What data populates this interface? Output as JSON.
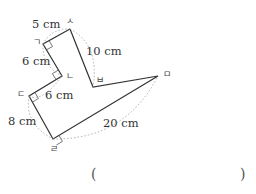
{
  "figure": {
    "vertices": [
      {
        "name": "ㄱ",
        "x": 43,
        "y": 44
      },
      {
        "name": "ㄴ",
        "x": 62,
        "y": 76
      },
      {
        "name": "ㄷ",
        "x": 29,
        "y": 96
      },
      {
        "name": "ㄹ",
        "x": 53,
        "y": 139
      },
      {
        "name": "ㅁ",
        "x": 158,
        "y": 76
      },
      {
        "name": "ㅂ",
        "x": 93,
        "y": 87
      },
      {
        "name": "ㅅ",
        "x": 70,
        "y": 29
      }
    ],
    "labels": {
      "v1": "ㄱ",
      "v2": "ㄴ",
      "v3": "ㄷ",
      "v4": "ㄹ",
      "v5": "ㅁ",
      "v6": "ㅂ",
      "v7": "ㅅ"
    },
    "lengths": {
      "gs": "5 cm",
      "gn": "6 cm",
      "nd": "6 cm",
      "dr": "8 cm",
      "rm": "20 cm",
      "sb": "10 cm"
    },
    "right_angles": [
      "ㄱ",
      "ㄴ",
      "ㄷ",
      "ㄹ"
    ]
  },
  "answer": {
    "open": "(",
    "close": ")",
    "value": ""
  }
}
